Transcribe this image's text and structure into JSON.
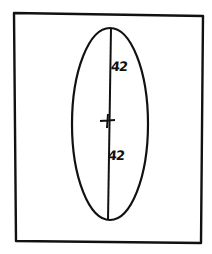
{
  "diagram": {
    "stroke_color": "#111111",
    "background": "#ffffff",
    "labels": {
      "upper_semi_axis": "42",
      "lower_semi_axis": "42"
    },
    "shapes": {
      "frame": "rectangle",
      "ellipse": "vertical ellipse",
      "axis": "major axis line",
      "center": "cross mark"
    }
  }
}
